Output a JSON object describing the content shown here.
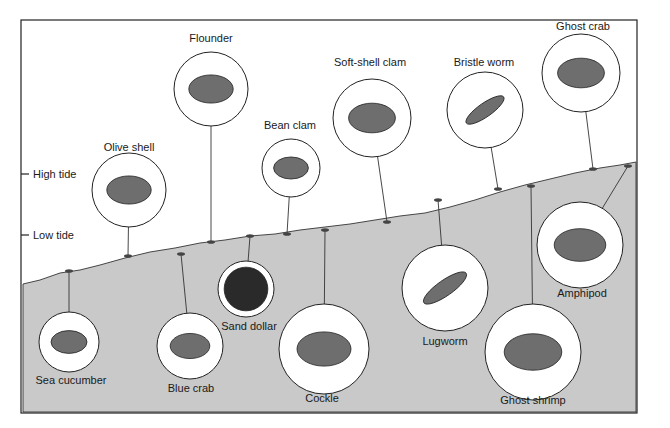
{
  "diagram": {
    "title": "",
    "colors": {
      "sand": "#c8c8c8",
      "water_bg": "#ffffff",
      "frame": "#222222",
      "circle_fill": "#ffffff"
    },
    "tide_markers": [
      {
        "label": "High tide",
        "y": 174
      },
      {
        "label": "Low tide",
        "y": 235
      }
    ],
    "organisms": [
      {
        "name": "Olive shell",
        "cx": 129,
        "cy": 190,
        "r": 37,
        "label_x": 129,
        "label_y": 147,
        "anchor": [
          128,
          256
        ],
        "icon": "olive-shell-icon"
      },
      {
        "name": "Flounder",
        "cx": 211,
        "cy": 89,
        "r": 37,
        "label_x": 211,
        "label_y": 38,
        "anchor": [
          211,
          242
        ],
        "icon": "flounder-icon"
      },
      {
        "name": "Bean clam",
        "cx": 291,
        "cy": 168,
        "r": 29,
        "label_x": 290,
        "label_y": 125,
        "anchor": [
          287,
          234
        ],
        "icon": "bean-clam-icon"
      },
      {
        "name": "Soft-shell clam",
        "cx": 372,
        "cy": 118,
        "r": 39,
        "label_x": 370,
        "label_y": 62,
        "anchor": [
          387,
          222
        ],
        "icon": "soft-shell-clam-icon"
      },
      {
        "name": "Bristle worm",
        "cx": 485,
        "cy": 110,
        "r": 38,
        "label_x": 484,
        "label_y": 62,
        "anchor": [
          498,
          189
        ],
        "icon": "bristle-worm-icon"
      },
      {
        "name": "Ghost crab",
        "cx": 581,
        "cy": 73,
        "r": 39,
        "label_x": 583,
        "label_y": 26,
        "anchor": [
          593,
          169
        ],
        "icon": "ghost-crab-icon"
      },
      {
        "name": "Sea cucumber",
        "cx": 69,
        "cy": 342,
        "r": 30,
        "label_x": 71,
        "label_y": 380,
        "anchor": [
          69,
          271
        ],
        "icon": "sea-cucumber-icon"
      },
      {
        "name": "Blue crab",
        "cx": 190,
        "cy": 346,
        "r": 33,
        "label_x": 191,
        "label_y": 388,
        "anchor": [
          181,
          254
        ],
        "icon": "blue-crab-icon"
      },
      {
        "name": "Sand dollar",
        "cx": 246,
        "cy": 289,
        "r": 28,
        "label_x": 249,
        "label_y": 326,
        "anchor": [
          250,
          236
        ],
        "icon": "sand-dollar-icon"
      },
      {
        "name": "Cockle",
        "cx": 324,
        "cy": 349,
        "r": 45,
        "label_x": 322,
        "label_y": 398,
        "anchor": [
          325,
          230
        ],
        "icon": "cockle-icon"
      },
      {
        "name": "Lugworm",
        "cx": 445,
        "cy": 288,
        "r": 43,
        "label_x": 445,
        "label_y": 341,
        "anchor": [
          438,
          200
        ],
        "icon": "lugworm-icon"
      },
      {
        "name": "Amphipod",
        "cx": 580,
        "cy": 245,
        "r": 43,
        "label_x": 582,
        "label_y": 293,
        "anchor": [
          628,
          166
        ],
        "icon": "amphipod-icon"
      },
      {
        "name": "Ghost shrimp",
        "cx": 533,
        "cy": 352,
        "r": 48,
        "label_x": 533,
        "label_y": 400,
        "anchor": [
          531,
          186
        ],
        "icon": "ghost-shrimp-icon"
      }
    ]
  }
}
